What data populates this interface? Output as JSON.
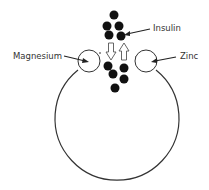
{
  "diagram": {
    "title": "",
    "labels": {
      "insulin": "Insulin",
      "magnesium": "Magnesium",
      "zinc": "Zinc"
    },
    "colors": {
      "stroke": "#333333",
      "dot": "#111111",
      "background": "#ffffff",
      "text": "#333333"
    },
    "cell": {
      "cx": 118,
      "cy": 118,
      "r": 62
    },
    "vesicles": [
      {
        "name": "magnesium",
        "cx": 89,
        "cy": 61,
        "r": 11
      },
      {
        "name": "zinc",
        "cx": 146,
        "cy": 61,
        "r": 11
      }
    ],
    "insulin_dots": [
      {
        "cx": 114,
        "cy": 15
      },
      {
        "cx": 107,
        "cy": 26
      },
      {
        "cx": 119,
        "cy": 26
      },
      {
        "cx": 109,
        "cy": 35
      },
      {
        "cx": 121,
        "cy": 36
      },
      {
        "cx": 108,
        "cy": 66
      },
      {
        "cx": 113,
        "cy": 74
      },
      {
        "cx": 124,
        "cy": 68
      },
      {
        "cx": 124,
        "cy": 79
      },
      {
        "cx": 115,
        "cy": 88
      }
    ],
    "arrows": [
      {
        "name": "down-arrow",
        "direction": "down",
        "x": 111,
        "y1": 43,
        "y2": 60
      },
      {
        "name": "up-arrow",
        "direction": "up",
        "x": 124,
        "y1": 43,
        "y2": 60
      }
    ]
  }
}
